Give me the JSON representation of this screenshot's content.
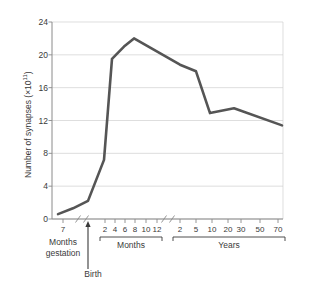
{
  "chart_data": {
    "type": "line",
    "title": "",
    "xlabel": "",
    "ylabel": "Number of synapses (×10",
    "ylabel_exponent": "11",
    "ylabel_tail": ")",
    "ylim": [
      0,
      24
    ],
    "yticks": [
      "0",
      "4",
      "8",
      "12",
      "16",
      "20",
      "24"
    ],
    "grid": true,
    "legend": null,
    "line_color": "#555555",
    "grid_color": "#d0d0d0",
    "axis_color": "#8a8a8a",
    "text_color": "#3a3a3a",
    "segments": [
      {
        "name": "gestation",
        "group_label": "Months gestation",
        "ticks": [
          "7"
        ],
        "tick_x": [
          63
        ]
      },
      {
        "name": "months",
        "group_label": "Months",
        "ticks": [
          "2",
          "4",
          "6",
          "8",
          "10",
          "12"
        ],
        "tick_x": [
          105,
          115,
          125,
          135,
          146,
          157
        ]
      },
      {
        "name": "years",
        "group_label": "Years",
        "ticks": [
          "2",
          "5",
          "10",
          "20",
          "30",
          "50",
          "70"
        ],
        "tick_x": [
          180,
          196,
          212,
          228,
          241,
          260,
          278
        ]
      }
    ],
    "birth_marker_label": "Birth",
    "points": [
      {
        "x": 58,
        "value": 0.6,
        "label": "7 months gestation"
      },
      {
        "x": 73,
        "value": 1.3,
        "label": ""
      },
      {
        "x": 88,
        "value": 2.2,
        "label": "Birth"
      },
      {
        "x": 104,
        "value": 7.2,
        "label": "2 months"
      },
      {
        "x": 112,
        "value": 19.5,
        "label": "4 months"
      },
      {
        "x": 124,
        "value": 21.0,
        "label": "6 months"
      },
      {
        "x": 134,
        "value": 22.0,
        "label": "8 months (peak)"
      },
      {
        "x": 180,
        "value": 18.8,
        "label": "2 years"
      },
      {
        "x": 196,
        "value": 18.0,
        "label": "5 years"
      },
      {
        "x": 210,
        "value": 12.9,
        "label": "10 years"
      },
      {
        "x": 234,
        "value": 13.5,
        "label": "20-30 years"
      },
      {
        "x": 282,
        "value": 11.4,
        "label": "70 years"
      }
    ]
  }
}
